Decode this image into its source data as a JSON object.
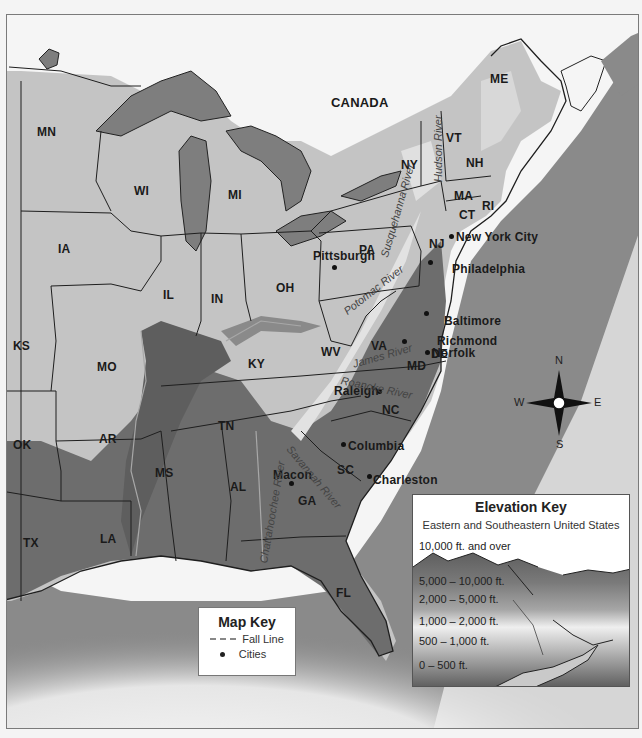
{
  "map": {
    "title_region": "Eastern and Southeastern United States",
    "country_label": "CANADA",
    "states": [
      {
        "abbr": "MN",
        "x": 36,
        "y": 124
      },
      {
        "abbr": "WI",
        "x": 133,
        "y": 183
      },
      {
        "abbr": "MI",
        "x": 227,
        "y": 187
      },
      {
        "abbr": "IA",
        "x": 57,
        "y": 241
      },
      {
        "abbr": "IL",
        "x": 162,
        "y": 287
      },
      {
        "abbr": "IN",
        "x": 210,
        "y": 291
      },
      {
        "abbr": "OH",
        "x": 275,
        "y": 280
      },
      {
        "abbr": "PA",
        "x": 358,
        "y": 242
      },
      {
        "abbr": "NY",
        "x": 400,
        "y": 157
      },
      {
        "abbr": "VT",
        "x": 445,
        "y": 130
      },
      {
        "abbr": "NH",
        "x": 465,
        "y": 155
      },
      {
        "abbr": "ME",
        "x": 489,
        "y": 71
      },
      {
        "abbr": "MA",
        "x": 453,
        "y": 188
      },
      {
        "abbr": "CT",
        "x": 458,
        "y": 207
      },
      {
        "abbr": "RI",
        "x": 481,
        "y": 198
      },
      {
        "abbr": "NJ",
        "x": 428,
        "y": 236
      },
      {
        "abbr": "DE",
        "x": 430,
        "y": 346
      },
      {
        "abbr": "MD",
        "x": 406,
        "y": 358
      },
      {
        "abbr": "WV",
        "x": 320,
        "y": 344
      },
      {
        "abbr": "VA",
        "x": 370,
        "y": 338
      },
      {
        "abbr": "KY",
        "x": 247,
        "y": 356
      },
      {
        "abbr": "KS",
        "x": 12,
        "y": 338
      },
      {
        "abbr": "MO",
        "x": 96,
        "y": 359
      },
      {
        "abbr": "TN",
        "x": 217,
        "y": 418
      },
      {
        "abbr": "NC",
        "x": 381,
        "y": 402
      },
      {
        "abbr": "SC",
        "x": 336,
        "y": 462
      },
      {
        "abbr": "AR",
        "x": 98,
        "y": 431
      },
      {
        "abbr": "OK",
        "x": 12,
        "y": 437
      },
      {
        "abbr": "MS",
        "x": 154,
        "y": 465
      },
      {
        "abbr": "AL",
        "x": 229,
        "y": 479
      },
      {
        "abbr": "GA",
        "x": 297,
        "y": 493
      },
      {
        "abbr": "TX",
        "x": 22,
        "y": 535
      },
      {
        "abbr": "LA",
        "x": 99,
        "y": 531
      },
      {
        "abbr": "FL",
        "x": 335,
        "y": 585
      }
    ],
    "cities": [
      {
        "name": "New York City",
        "label_x": 455,
        "label_y": 229,
        "dot_x": 450,
        "dot_y": 235
      },
      {
        "name": "Philadelphia",
        "label_x": 451,
        "label_y": 261,
        "dot_x": 429,
        "dot_y": 261
      },
      {
        "name": "Pittsburgh",
        "label_x": 312,
        "label_y": 248,
        "dot_x": 333,
        "dot_y": 266
      },
      {
        "name": "Baltimore",
        "label_x": 443,
        "label_y": 313,
        "dot_x": 425,
        "dot_y": 312
      },
      {
        "name": "Richmond",
        "label_x": 436,
        "label_y": 333,
        "dot_x": 403,
        "dot_y": 340
      },
      {
        "name": "Norfolk",
        "label_x": 431,
        "label_y": 345,
        "dot_x": 426,
        "dot_y": 351
      },
      {
        "name": "Raleigh",
        "label_x": 333,
        "label_y": 383,
        "dot_x": 378,
        "dot_y": 390
      },
      {
        "name": "Columbia",
        "label_x": 347,
        "label_y": 438,
        "dot_x": 342,
        "dot_y": 443
      },
      {
        "name": "Charleston",
        "label_x": 372,
        "label_y": 472,
        "dot_x": 368,
        "dot_y": 475
      },
      {
        "name": "Macon",
        "label_x": 272,
        "label_y": 467,
        "dot_x": 290,
        "dot_y": 482
      }
    ],
    "rivers": [
      {
        "name": "Susquehanna River",
        "x": 383,
        "y": 250,
        "rotate": -74
      },
      {
        "name": "Hudson River",
        "x": 437,
        "y": 175,
        "rotate": -90
      },
      {
        "name": "Potomac River",
        "x": 344,
        "y": 305,
        "rotate": -38
      },
      {
        "name": "James River",
        "x": 352,
        "y": 357,
        "rotate": -16
      },
      {
        "name": "Roanoke River",
        "x": 340,
        "y": 373,
        "rotate": 12
      },
      {
        "name": "Savannah River",
        "x": 288,
        "y": 440,
        "rotate": 50
      },
      {
        "name": "Chattahoochee River",
        "x": 262,
        "y": 556,
        "rotate": -80
      }
    ]
  },
  "compass": {
    "north": "N",
    "south": "S",
    "east": "E",
    "west": "W"
  },
  "map_key": {
    "title": "Map Key",
    "items": [
      {
        "symbol": "dashed-line",
        "label": "Fall Line"
      },
      {
        "symbol": "dot",
        "label": "Cities"
      }
    ]
  },
  "elevation_key": {
    "title": "Elevation Key",
    "subtitle": "Eastern and Southeastern United States",
    "bands": [
      {
        "label": "10,000 ft. and over",
        "color": "#6e6e6e"
      },
      {
        "label": "5,000 – 10,000 ft.",
        "color": "#8a8a8a"
      },
      {
        "label": "2,000 – 5,000 ft.",
        "color": "#b0b0b0"
      },
      {
        "label": "1,000 – 2,000 ft.",
        "color": "#e6e6e6"
      },
      {
        "label": "500 – 1,000 ft.",
        "color": "#b9b9b9"
      },
      {
        "label": "0 – 500 ft.",
        "color": "#6a6a6a"
      }
    ]
  },
  "colors": {
    "ocean": "#8c8c8c",
    "lakes": "#7e7e7e",
    "lowland": "#6c6c6c",
    "upland": "#c8c8c8",
    "highland": "#dcdcdc",
    "canada": "#f4f4f4",
    "border": "#222222"
  }
}
